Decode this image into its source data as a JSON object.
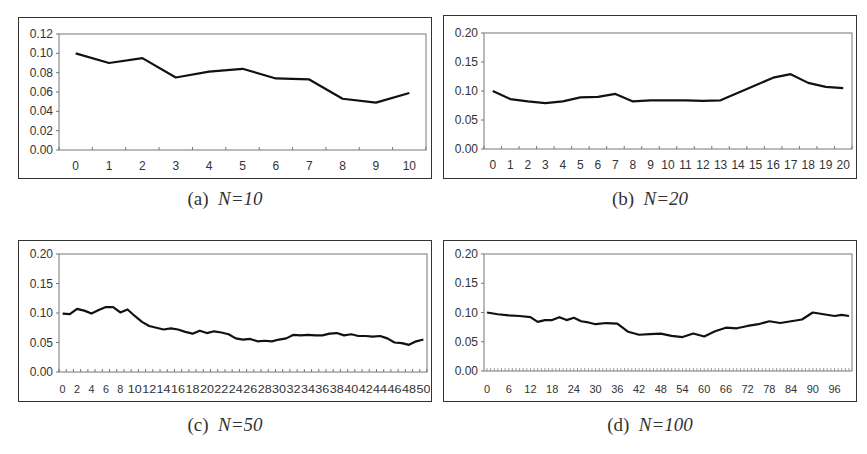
{
  "chart_data": [
    {
      "type": "line",
      "title": "(a) N=10",
      "caption_prefix": "(a)",
      "caption_n": "N=10",
      "xlabel": "",
      "ylabel": "",
      "ylim": [
        0,
        0.12
      ],
      "yticks": [
        "0.00",
        "0.02",
        "0.04",
        "0.06",
        "0.08",
        "0.10",
        "0.12"
      ],
      "xticks": [
        "0",
        "1",
        "2",
        "3",
        "4",
        "5",
        "6",
        "7",
        "8",
        "9",
        "10"
      ],
      "grid": false,
      "x": [
        0,
        1,
        2,
        3,
        4,
        5,
        6,
        7,
        8,
        9,
        10
      ],
      "values": [
        0.1,
        0.09,
        0.095,
        0.075,
        0.081,
        0.084,
        0.074,
        0.073,
        0.053,
        0.049,
        0.059
      ]
    },
    {
      "type": "line",
      "title": "(b) N=20",
      "caption_prefix": "(b)",
      "caption_n": "N=20",
      "xlabel": "",
      "ylabel": "",
      "ylim": [
        0,
        0.2
      ],
      "yticks": [
        "0.00",
        "0.05",
        "0.10",
        "0.15",
        "0.20"
      ],
      "xticks": [
        "0",
        "1",
        "2",
        "3",
        "4",
        "5",
        "6",
        "7",
        "8",
        "9",
        "10",
        "11",
        "12",
        "13",
        "14",
        "15",
        "16",
        "17",
        "18",
        "19",
        "20"
      ],
      "grid": false,
      "x": [
        0,
        1,
        2,
        3,
        4,
        5,
        6,
        7,
        8,
        9,
        10,
        11,
        12,
        13,
        14,
        15,
        16,
        17,
        18,
        19,
        20
      ],
      "values": [
        0.1,
        0.086,
        0.082,
        0.079,
        0.082,
        0.089,
        0.09,
        0.095,
        0.082,
        0.084,
        0.084,
        0.084,
        0.083,
        0.084,
        0.097,
        0.11,
        0.123,
        0.129,
        0.114,
        0.107,
        0.105
      ]
    },
    {
      "type": "line",
      "title": "(c) N=50",
      "caption_prefix": "(c)",
      "caption_n": "N=50",
      "xlabel": "",
      "ylabel": "",
      "ylim": [
        0,
        0.2
      ],
      "yticks": [
        "0.00",
        "0.05",
        "0.10",
        "0.15",
        "0.20"
      ],
      "xticks": [
        "0",
        "2",
        "4",
        "6",
        "8",
        "10",
        "12",
        "14",
        "16",
        "18",
        "20",
        "22",
        "24",
        "26",
        "28",
        "30",
        "32",
        "34",
        "36",
        "38",
        "40",
        "42",
        "44",
        "46",
        "48",
        "50"
      ],
      "grid": false,
      "x": [
        0,
        1,
        2,
        3,
        4,
        5,
        6,
        7,
        8,
        9,
        10,
        11,
        12,
        13,
        14,
        15,
        16,
        17,
        18,
        19,
        20,
        21,
        22,
        23,
        24,
        25,
        26,
        27,
        28,
        29,
        30,
        31,
        32,
        33,
        34,
        35,
        36,
        37,
        38,
        39,
        40,
        41,
        42,
        43,
        44,
        45,
        46,
        47,
        48,
        49,
        50
      ],
      "values": [
        0.099,
        0.098,
        0.107,
        0.104,
        0.099,
        0.105,
        0.11,
        0.11,
        0.101,
        0.106,
        0.095,
        0.085,
        0.078,
        0.075,
        0.072,
        0.074,
        0.072,
        0.068,
        0.065,
        0.07,
        0.066,
        0.069,
        0.067,
        0.064,
        0.057,
        0.055,
        0.056,
        0.052,
        0.053,
        0.052,
        0.055,
        0.057,
        0.063,
        0.062,
        0.063,
        0.062,
        0.062,
        0.065,
        0.066,
        0.062,
        0.064,
        0.061,
        0.061,
        0.06,
        0.061,
        0.057,
        0.05,
        0.049,
        0.046,
        0.052,
        0.055
      ]
    },
    {
      "type": "line",
      "title": "(d) N=100",
      "caption_prefix": "(d)",
      "caption_n": "N=100",
      "xlabel": "",
      "ylabel": "",
      "ylim": [
        0,
        0.2
      ],
      "yticks": [
        "0.00",
        "0.05",
        "0.10",
        "0.15",
        "0.20"
      ],
      "xticks": [
        "0",
        "6",
        "12",
        "18",
        "24",
        "30",
        "36",
        "42",
        "48",
        "54",
        "60",
        "66",
        "72",
        "78",
        "84",
        "90",
        "96"
      ],
      "grid": false,
      "x_range": [
        0,
        100
      ],
      "keypoints_x": [
        0,
        3,
        6,
        9,
        12,
        14,
        16,
        18,
        20,
        22,
        24,
        26,
        28,
        30,
        33,
        36,
        39,
        42,
        45,
        48,
        51,
        54,
        57,
        60,
        63,
        66,
        69,
        72,
        75,
        78,
        81,
        84,
        87,
        90,
        93,
        96,
        98,
        100
      ],
      "values": [
        0.1,
        0.097,
        0.095,
        0.094,
        0.092,
        0.084,
        0.087,
        0.087,
        0.092,
        0.087,
        0.091,
        0.085,
        0.083,
        0.08,
        0.082,
        0.081,
        0.067,
        0.062,
        0.063,
        0.064,
        0.06,
        0.058,
        0.064,
        0.059,
        0.068,
        0.074,
        0.073,
        0.077,
        0.08,
        0.085,
        0.082,
        0.085,
        0.088,
        0.1,
        0.097,
        0.094,
        0.096,
        0.094
      ]
    }
  ],
  "panels": [
    {
      "caption_prefix": "(a)",
      "caption_n": "N=10"
    },
    {
      "caption_prefix": "(b)",
      "caption_n": "N=20"
    },
    {
      "caption_prefix": "(c)",
      "caption_n": "N=50"
    },
    {
      "caption_prefix": "(d)",
      "caption_n": "N=100"
    }
  ],
  "style": {
    "line_color": "#111111",
    "axis_color": "#777777",
    "frame_color": "#333333"
  }
}
